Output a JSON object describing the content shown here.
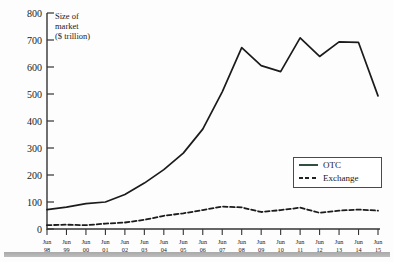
{
  "figure": {
    "top_sliver_text": "",
    "axis_label_line1": "Size of",
    "axis_label_line2": "market",
    "axis_label_line3": "($ trillion)"
  },
  "legend": {
    "position": "inside-right",
    "items": [
      {
        "label": "OTC",
        "style": "solid",
        "color": "#2f4f3f",
        "icon": "solid-line-icon"
      },
      {
        "label": "Exchange",
        "style": "dashed",
        "color": "#222222",
        "icon": "dashed-line-icon"
      }
    ]
  },
  "colors": {
    "otc_line": "#1b1b1b",
    "exchange_line": "#1b1b1b",
    "axis": "#333333",
    "legend_otc_swatch": "#2f4f3f",
    "bottom_rule": "#a9a9a9",
    "background": "#fdfdfd"
  },
  "chart_data": {
    "type": "line",
    "title": "",
    "subtitle": "",
    "xlabel": "",
    "ylabel": "Size of market ($ trillion)",
    "ylim": [
      0,
      800
    ],
    "ytick_values": [
      0,
      100,
      200,
      300,
      400,
      500,
      600,
      700,
      800
    ],
    "ytick_labels": [
      "0",
      "100",
      "200",
      "300",
      "400",
      "500",
      "600",
      "700",
      "800"
    ],
    "grid": false,
    "legend_position": "inside-right",
    "x_tick_prefix": "Jun",
    "categories": [
      "Jun 98",
      "Jun 99",
      "Jun 00",
      "Jun 01",
      "Jun 02",
      "Jun 03",
      "Jun 04",
      "Jun 05",
      "Jun 06",
      "Jun 07",
      "Jun 08",
      "Jun 09",
      "Jun 10",
      "Jun 11",
      "Jun 12",
      "Jun 13",
      "Jun 14",
      "Jun 15"
    ],
    "x_tick_top": [
      "Jun",
      "Jun",
      "Jun",
      "Jun",
      "Jun",
      "Jun",
      "Jun",
      "Jun",
      "Jun",
      "Jun",
      "Jun",
      "Jun",
      "Jun",
      "Jun",
      "Jun",
      "Jun",
      "Jun",
      "Jun"
    ],
    "x_tick_bottom": [
      "98",
      "99",
      "00",
      "01",
      "02",
      "03",
      "04",
      "05",
      "06",
      "07",
      "08",
      "09",
      "10",
      "11",
      "12",
      "13",
      "14",
      "15"
    ],
    "series": [
      {
        "name": "OTC",
        "style": "solid",
        "values": [
          72,
          81,
          94,
          100,
          128,
          170,
          220,
          281,
          370,
          508,
          672,
          605,
          583,
          708,
          639,
          693,
          691,
          493
        ]
      },
      {
        "name": "Exchange",
        "style": "dashed",
        "values": [
          14,
          16,
          14,
          20,
          24,
          34,
          49,
          58,
          70,
          83,
          80,
          63,
          70,
          79,
          60,
          68,
          72,
          68
        ]
      }
    ]
  }
}
